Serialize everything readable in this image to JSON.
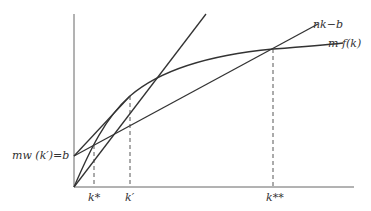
{
  "diagram": {
    "labels": {
      "line_nk_b": "nk−b",
      "curve_mf": "m f(k)",
      "intercept": "mw (k′)=b",
      "k_star": "k*",
      "k_prime": "k′",
      "k_double_star": "k**"
    },
    "colors": {
      "stroke": "#333333",
      "axis": "#555555",
      "background": "#ffffff"
    }
  }
}
